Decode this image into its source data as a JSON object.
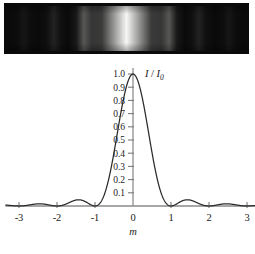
{
  "figure": {
    "name": "single-slit-diffraction-figure",
    "photo": {
      "alt": "single-slit diffraction fringe photograph",
      "background_color": "#0a0a0a",
      "bright_color": "#f6f6f4",
      "fringes": [
        {
          "center_m": 0.0,
          "relative_intensity": 1.0,
          "half_width_m": 0.82
        },
        {
          "center_m": -1.43,
          "relative_intensity": 0.28,
          "half_width_m": 0.26
        },
        {
          "center_m": 1.43,
          "relative_intensity": 0.28,
          "half_width_m": 0.26
        },
        {
          "center_m": -2.46,
          "relative_intensity": 0.1,
          "half_width_m": 0.24
        },
        {
          "center_m": 2.46,
          "relative_intensity": 0.1,
          "half_width_m": 0.24
        },
        {
          "center_m": -3.47,
          "relative_intensity": 0.05,
          "half_width_m": 0.22
        },
        {
          "center_m": 3.47,
          "relative_intensity": 0.05,
          "half_width_m": 0.22
        }
      ]
    }
  },
  "chart_data": {
    "type": "line",
    "title": "",
    "subtitle": "",
    "xlabel": "m",
    "ylabel": "I / I_0",
    "ylabel_numerator": "I",
    "ylabel_divider": "/",
    "ylabel_denominator": "I",
    "ylabel_subscript": "0",
    "xlim": [
      -3.35,
      3.35
    ],
    "ylim": [
      0,
      1.0
    ],
    "grid": false,
    "legend": null,
    "x_ticks": [
      -3,
      -2,
      -1,
      0,
      1,
      2,
      3
    ],
    "x_tick_labels": [
      "-3",
      "-2",
      "-1",
      "0",
      "1",
      "2",
      "3"
    ],
    "y_ticks": [
      0.1,
      0.2,
      0.3,
      0.4,
      0.5,
      0.6,
      0.7,
      0.8,
      0.9,
      1.0
    ],
    "y_tick_labels": [
      "0.1",
      "0.2",
      "0.3",
      "0.4",
      "0.5",
      "0.6",
      "0.7",
      "0.8",
      "0.9",
      "1.0"
    ],
    "series": [
      {
        "name": "single-slit intensity",
        "function": "sinc-squared",
        "formula": "I/I_0 = (sin(pi*m)/(pi*m))^2",
        "color": "#2b2b2b",
        "key_points": [
          {
            "m": 0.0,
            "value": 1.0
          },
          {
            "m": 0.25,
            "value": 0.811
          },
          {
            "m": 0.5,
            "value": 0.405
          },
          {
            "m": 0.75,
            "value": 0.09
          },
          {
            "m": 1.0,
            "value": 0.0
          },
          {
            "m": 1.43,
            "value": 0.047
          },
          {
            "m": 2.0,
            "value": 0.0
          },
          {
            "m": 2.46,
            "value": 0.017
          },
          {
            "m": 3.0,
            "value": 0.0
          }
        ]
      }
    ]
  }
}
